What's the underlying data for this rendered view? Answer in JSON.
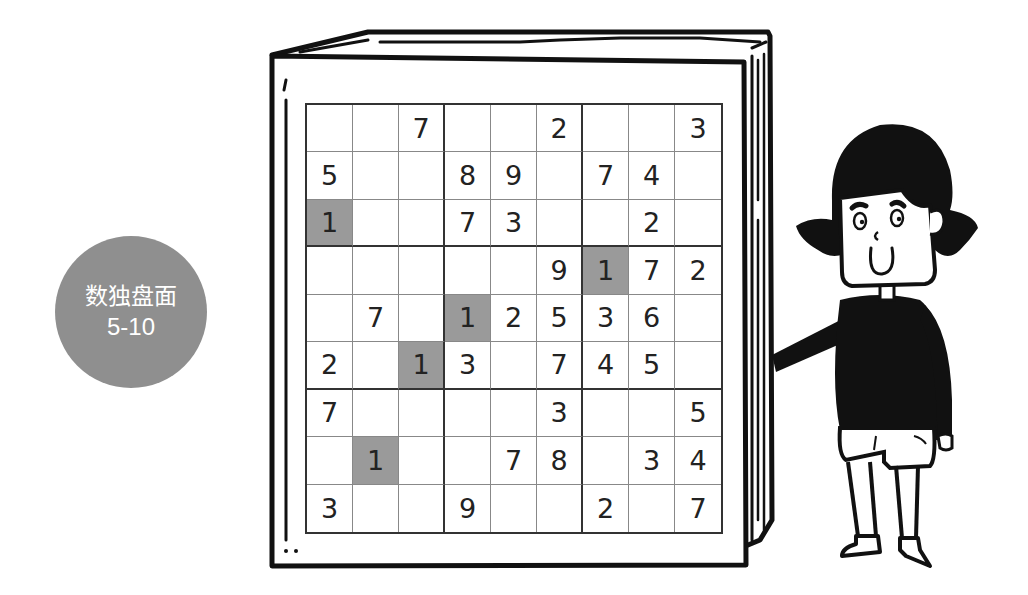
{
  "badge": {
    "title": "数独盘面",
    "subtitle": "5-10",
    "color": "#8f8f8f"
  },
  "puzzle": {
    "shaded_color": "#9a9a9a",
    "rows": [
      [
        "",
        "",
        "7",
        "",
        "",
        "2",
        "",
        "",
        "3"
      ],
      [
        "5",
        "",
        "",
        "8",
        "9",
        "",
        "7",
        "4",
        ""
      ],
      [
        "1",
        "",
        "",
        "7",
        "3",
        "",
        "",
        "2",
        ""
      ],
      [
        "",
        "",
        "",
        "",
        "",
        "9",
        "1",
        "7",
        "2"
      ],
      [
        "",
        "7",
        "",
        "1",
        "2",
        "5",
        "3",
        "6",
        ""
      ],
      [
        "2",
        "",
        "1",
        "3",
        "",
        "7",
        "4",
        "5",
        ""
      ],
      [
        "7",
        "",
        "",
        "",
        "",
        "3",
        "",
        "",
        "5"
      ],
      [
        "",
        "1",
        "",
        "",
        "7",
        "8",
        "",
        "3",
        "4"
      ],
      [
        "3",
        "",
        "",
        "9",
        "",
        "",
        "2",
        "",
        "7"
      ]
    ],
    "shaded_cells": [
      [
        2,
        0
      ],
      [
        3,
        6
      ],
      [
        4,
        3
      ],
      [
        5,
        2
      ],
      [
        7,
        1
      ]
    ]
  },
  "illustration": {
    "book": "open-book-icon",
    "character": "girl-pointing-icon"
  }
}
